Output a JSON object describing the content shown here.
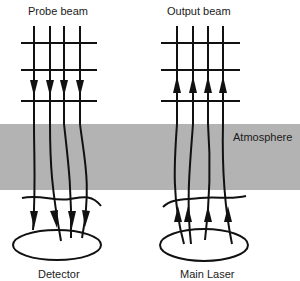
{
  "labels": {
    "probe_beam": "Probe beam",
    "output_beam": "Output beam",
    "atmosphere": "Atmosphere",
    "detector": "Detector",
    "main_laser": "Main Laser"
  },
  "colors": {
    "atmosphere_band": "#b3b3b3",
    "stroke": "#111111",
    "background": "#ffffff"
  },
  "diagram": {
    "left_panel": {
      "title": "Probe beam",
      "direction": "down",
      "beam_count": 4,
      "grid_lines": 3,
      "endpoint": "Detector"
    },
    "right_panel": {
      "title": "Output beam",
      "direction": "up",
      "beam_count": 4,
      "grid_lines": 3,
      "endpoint": "Main Laser"
    },
    "medium": "Atmosphere"
  }
}
